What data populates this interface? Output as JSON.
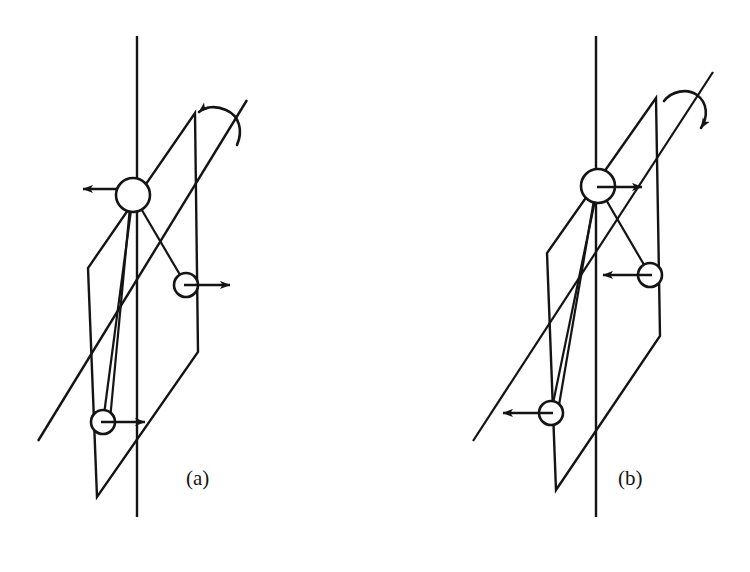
{
  "figure": {
    "title": "",
    "background_color": "#ffffff",
    "stroke_color": "#141414",
    "fill_color": "#ffffff",
    "width": 750,
    "height": 572,
    "panels": [
      {
        "id": "a",
        "label": "(a)",
        "label_x": 186,
        "label_y": 485,
        "description": "Molecular vibration mode diagram: mirror plane parallelogram with vertical axis, inclined rotation axis with counterclockwise curved arrow, three atoms with displacement arrows",
        "vertical_axis": {
          "x1": 137,
          "y1": 36,
          "x2": 137,
          "y2": 517
        },
        "rotation_axis": {
          "x1": 38,
          "y1": 441,
          "x2": 247,
          "y2": 100
        },
        "rotation_arrow": {
          "direction": "counterclockwise",
          "arrowhead": "left",
          "pivot_x": 222,
          "pivot_y": 122
        },
        "plane": {
          "points": "195,113 198,352 97,497 88,268",
          "corner_top": [
            195,
            113
          ],
          "corner_right": [
            198,
            352
          ],
          "corner_bottom": [
            97,
            497
          ],
          "corner_left": [
            88,
            268
          ]
        },
        "atoms": [
          {
            "name": "atom-top",
            "cx": 133,
            "cy": 195,
            "r": 17,
            "arrow": {
              "direction": "left",
              "from_x": 116,
              "from_y": 189,
              "to_x": 82,
              "to_y": 189
            }
          },
          {
            "name": "atom-middle",
            "cx": 186,
            "cy": 285,
            "r": 12,
            "arrow": {
              "direction": "right",
              "from_x": 186,
              "from_y": 285,
              "to_x": 228,
              "to_y": 285
            }
          },
          {
            "name": "atom-bottom",
            "cx": 103,
            "cy": 422,
            "r": 12,
            "arrow": {
              "direction": "right",
              "from_x": 103,
              "from_y": 422,
              "to_x": 143,
              "to_y": 422
            }
          }
        ],
        "bonds": [
          {
            "from": "atom-top",
            "to": "atom-middle"
          },
          {
            "from": "atom-top",
            "to": "atom-bottom"
          }
        ]
      },
      {
        "id": "b",
        "label": "(b)",
        "label_x": 618,
        "label_y": 485,
        "description": "Molecular vibration mode diagram: mirror plane parallelogram with vertical axis, inclined rotation axis with clockwise curved arrow, three atoms with reversed displacement arrows",
        "vertical_axis": {
          "x1": 596,
          "y1": 36,
          "x2": 596,
          "y2": 517
        },
        "rotation_axis": {
          "x1": 473,
          "y1": 441,
          "x2": 713,
          "y2": 72
        },
        "rotation_arrow": {
          "direction": "clockwise",
          "arrowhead": "down-right",
          "pivot_x": 686,
          "pivot_y": 96
        },
        "plane": {
          "points": "656,98 660,336 556,490 547,253",
          "corner_top": [
            656,
            98
          ],
          "corner_right": [
            660,
            336
          ],
          "corner_bottom": [
            556,
            490
          ],
          "corner_left": [
            547,
            253
          ]
        },
        "atoms": [
          {
            "name": "atom-top",
            "cx": 598,
            "cy": 186,
            "r": 17,
            "arrow": {
              "direction": "right",
              "from_x": 598,
              "from_y": 187,
              "to_x": 640,
              "to_y": 187
            }
          },
          {
            "name": "atom-middle",
            "cx": 650,
            "cy": 275,
            "r": 12,
            "arrow": {
              "direction": "left",
              "from_x": 650,
              "from_y": 275,
              "to_x": 605,
              "to_y": 275
            }
          },
          {
            "name": "atom-bottom",
            "cx": 551,
            "cy": 413,
            "r": 12,
            "arrow": {
              "direction": "left",
              "from_x": 551,
              "from_y": 413,
              "to_x": 505,
              "to_y": 413
            }
          }
        ],
        "bonds": [
          {
            "from": "atom-top",
            "to": "atom-middle"
          },
          {
            "from": "atom-top",
            "to": "atom-bottom"
          }
        ]
      }
    ]
  }
}
